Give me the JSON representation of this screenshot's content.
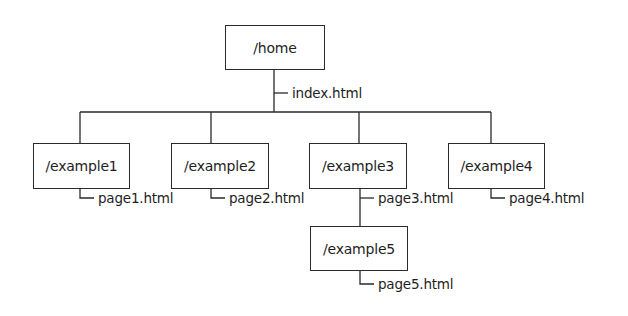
{
  "diagram": {
    "type": "site-directory-tree",
    "root": {
      "id": "home",
      "label": "/home",
      "page": "index.html"
    },
    "nodes": [
      {
        "id": "example1",
        "label": "/example1",
        "page": "page1.html",
        "parent": "home"
      },
      {
        "id": "example2",
        "label": "/example2",
        "page": "page2.html",
        "parent": "home"
      },
      {
        "id": "example3",
        "label": "/example3",
        "page": "page3.html",
        "parent": "home"
      },
      {
        "id": "example4",
        "label": "/example4",
        "page": "page4.html",
        "parent": "home"
      },
      {
        "id": "example5",
        "label": "/example5",
        "page": "page5.html",
        "parent": "example3"
      }
    ],
    "colors": {
      "line": "#2a2a2a",
      "text": "#1e1e1e",
      "background": "#ffffff"
    }
  }
}
